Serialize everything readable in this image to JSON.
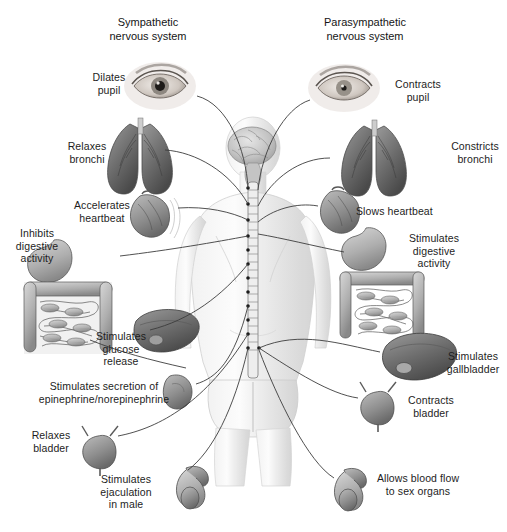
{
  "figure": {
    "width": 507,
    "height": 532,
    "background": "#ffffff",
    "text_color": "#1d1d1d",
    "line_color": "#3a3a3a",
    "style": "grayscale medical illustration"
  },
  "headings": {
    "sympathetic": "Sympathetic\nnervous system",
    "parasympathetic": "Parasympathetic\nnervous system"
  },
  "sympathetic_labels": [
    {
      "id": "dilates-pupil",
      "text": "Dilates\npupil",
      "organ": "eye"
    },
    {
      "id": "relaxes-bronchi",
      "text": "Relaxes\nbronchi",
      "organ": "lungs"
    },
    {
      "id": "accelerates-heartbeat",
      "text": "Accelerates\nheartbeat",
      "organ": "heart"
    },
    {
      "id": "inhibits-digestion",
      "text": "Inhibits\ndigestive\nactivity",
      "organ": "stomach-intestines"
    },
    {
      "id": "stimulates-glucose",
      "text": "Stimulates\nglucose\nrelease",
      "organ": "liver"
    },
    {
      "id": "stimulates-epinephrine",
      "text": "Stimulates secretion of\nepinephrine/norepinephrine",
      "organ": "adrenal-gland"
    },
    {
      "id": "relaxes-bladder",
      "text": "Relaxes\nbladder",
      "organ": "bladder"
    },
    {
      "id": "stimulates-ejaculation",
      "text": "Stimulates\nejaculation\nin male",
      "organ": "male-genitals"
    }
  ],
  "parasympathetic_labels": [
    {
      "id": "contracts-pupil",
      "text": "Contracts\npupil",
      "organ": "eye"
    },
    {
      "id": "constricts-bronchi",
      "text": "Constricts\nbronchi",
      "organ": "lungs"
    },
    {
      "id": "slows-heartbeat",
      "text": "Slows heartbeat",
      "organ": "heart"
    },
    {
      "id": "stimulates-digestion",
      "text": "Stimulates\ndigestive\nactivity",
      "organ": "stomach-intestines"
    },
    {
      "id": "stimulates-gallbladder",
      "text": "Stimulates\ngallbladder",
      "organ": "liver-gallbladder"
    },
    {
      "id": "contracts-bladder",
      "text": "Contracts\nbladder",
      "organ": "bladder"
    },
    {
      "id": "allows-blood-flow",
      "text": "Allows blood flow\nto sex organs",
      "organ": "male-genitals"
    }
  ],
  "central_figure": {
    "description": "Human body seen from behind with brain and segmented spinal cord",
    "parts": [
      "brain",
      "spinal-cord",
      "torso",
      "arms",
      "legs"
    ]
  }
}
